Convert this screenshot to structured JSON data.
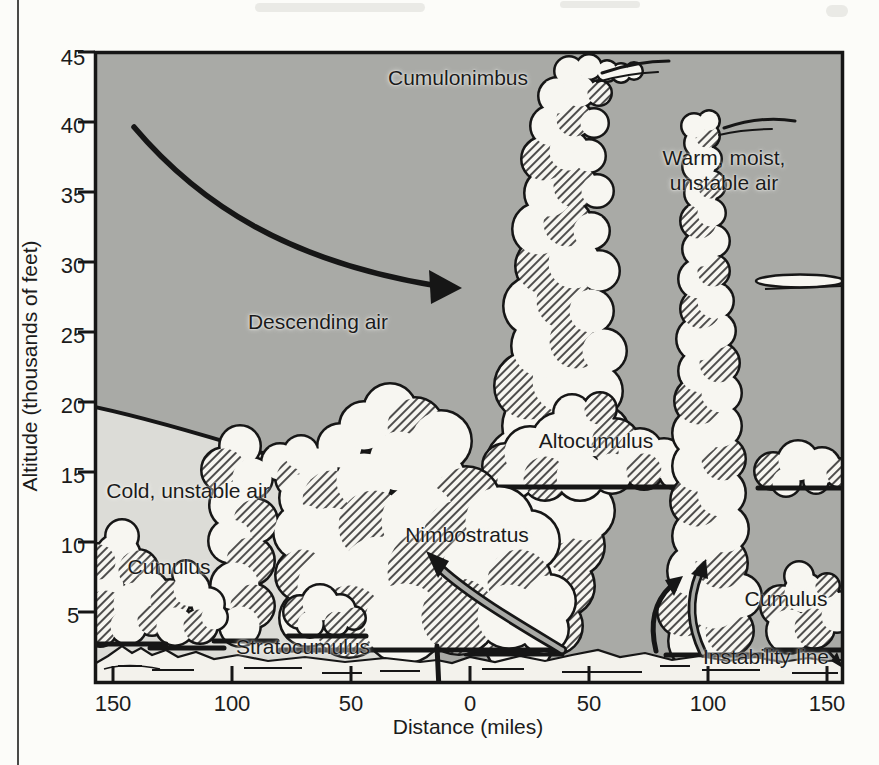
{
  "figure": {
    "type": "squall-line cross-section diagram",
    "y_axis": {
      "title": "Altitude (thousands of feet)",
      "ticks": [
        "45",
        "40",
        "35",
        "30",
        "25",
        "20",
        "15",
        "10",
        "5"
      ]
    },
    "x_axis": {
      "title": "Distance (miles)",
      "ticks": [
        "150",
        "100",
        "50",
        "0",
        "50",
        "100",
        "150"
      ]
    },
    "labels": {
      "cumulonimbus": "Cumulonimbus",
      "warm_moist": "Warm, moist,\nunstable air",
      "descending_air": "Descending air",
      "cold_unstable_air": "Cold, unstable air",
      "altocumulus": "Altocumulus",
      "nimbostratus": "Nimbostratus",
      "cumulus_left": "Cumulus",
      "stratocumulus": "Stratocumulus",
      "cumulus_right": "Cumulus",
      "instability_line": "Instability line"
    },
    "colors": {
      "sky": "#a9aaa6",
      "cold_air": "#dcdcd7",
      "cloud": "#f7f6f1",
      "ground": "#f3f2ec",
      "ink": "#161616",
      "page": "#fcfcf9"
    }
  }
}
